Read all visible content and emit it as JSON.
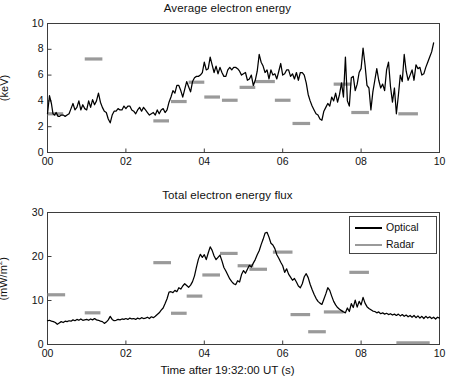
{
  "figure": {
    "background": "#ffffff",
    "optical_color": "#000000",
    "radar_color": "#9a9a9a",
    "axis_color": "#3d3d3d"
  },
  "legend": {
    "position": "top-right-of-bottom-panel",
    "entries": [
      {
        "label": "Optical",
        "color": "#000000"
      },
      {
        "label": "Radar",
        "color": "#9a9a9a"
      }
    ]
  },
  "chart_data": [
    {
      "type": "line",
      "id": "average-electron-energy",
      "title": "Average electron energy",
      "xlabel": "",
      "ylabel": "(keV)",
      "xlim": [
        0,
        10
      ],
      "ylim": [
        0,
        10
      ],
      "xticks": [
        0,
        2,
        4,
        6,
        8,
        10
      ],
      "xticklabels": [
        "00",
        "02",
        "04",
        "06",
        "08",
        "10"
      ],
      "yticks": [
        0,
        2,
        4,
        6,
        8,
        10
      ],
      "yticklabels": [
        "0",
        "2",
        "4",
        "6",
        "8",
        "10"
      ],
      "grid": false,
      "legend": false,
      "series": [
        {
          "name": "Optical",
          "color": "#000000",
          "style": "line",
          "x": [
            0.0,
            0.05,
            0.1,
            0.14,
            0.18,
            0.22,
            0.27,
            0.31,
            0.35,
            0.4,
            0.45,
            0.5,
            0.55,
            0.6,
            0.65,
            0.7,
            0.75,
            0.8,
            0.85,
            0.9,
            0.95,
            1.0,
            1.05,
            1.1,
            1.15,
            1.2,
            1.25,
            1.3,
            1.35,
            1.4,
            1.45,
            1.5,
            1.55,
            1.6,
            1.65,
            1.7,
            1.75,
            1.8,
            1.85,
            1.9,
            1.95,
            2.0,
            2.05,
            2.1,
            2.15,
            2.2,
            2.25,
            2.3,
            2.35,
            2.4,
            2.45,
            2.5,
            2.55,
            2.6,
            2.65,
            2.7,
            2.75,
            2.8,
            2.85,
            2.9,
            2.95,
            3.0,
            3.05,
            3.1,
            3.15,
            3.2,
            3.25,
            3.3,
            3.35,
            3.4,
            3.45,
            3.5,
            3.55,
            3.6,
            3.65,
            3.7,
            3.75,
            3.8,
            3.85,
            3.9,
            3.95,
            4.0,
            4.05,
            4.1,
            4.15,
            4.2,
            4.25,
            4.3,
            4.35,
            4.4,
            4.45,
            4.5,
            4.55,
            4.6,
            4.65,
            4.7,
            4.75,
            4.8,
            4.85,
            4.9,
            4.95,
            5.0,
            5.05,
            5.1,
            5.15,
            5.2,
            5.25,
            5.3,
            5.35,
            5.4,
            5.45,
            5.5,
            5.55,
            5.6,
            5.65,
            5.7,
            5.75,
            5.8,
            5.85,
            5.9,
            5.95,
            6.0,
            6.05,
            6.1,
            6.15,
            6.2,
            6.25,
            6.3,
            6.35,
            6.4,
            6.45,
            6.5,
            6.55,
            6.6,
            6.65,
            6.7,
            6.75,
            6.8,
            6.85,
            6.9,
            6.95,
            7.0,
            7.05,
            7.1,
            7.15,
            7.2,
            7.25,
            7.3,
            7.35,
            7.4,
            7.45,
            7.5,
            7.55,
            7.6,
            7.65,
            7.7,
            7.75,
            7.8,
            7.85,
            7.9,
            7.95,
            8.0,
            8.05,
            8.1,
            8.15,
            8.2,
            8.25,
            8.3,
            8.35,
            8.4,
            8.45,
            8.5,
            8.55,
            8.6,
            8.65,
            8.7,
            8.75,
            8.8,
            8.85,
            8.9,
            8.95,
            9.0,
            9.05,
            9.1,
            9.15,
            9.2,
            9.25,
            9.3,
            9.35,
            9.4,
            9.45,
            9.5,
            9.55,
            9.6,
            9.65,
            9.7,
            9.75,
            9.8,
            9.85,
            9.9,
            9.95,
            10.0
          ],
          "y": [
            3.0,
            4.4,
            3.8,
            3.0,
            2.9,
            3.1,
            2.8,
            2.8,
            2.9,
            2.9,
            2.8,
            2.9,
            3.0,
            3.4,
            3.8,
            3.3,
            3.5,
            4.0,
            3.3,
            3.7,
            3.4,
            3.3,
            4.0,
            3.5,
            4.1,
            3.7,
            4.0,
            4.6,
            3.9,
            3.5,
            3.2,
            3.1,
            2.6,
            2.3,
            2.9,
            3.2,
            3.2,
            3.4,
            3.3,
            3.3,
            3.6,
            3.4,
            3.6,
            3.6,
            3.3,
            3.2,
            3.0,
            3.3,
            3.5,
            3.2,
            3.5,
            3.3,
            3.1,
            2.9,
            3.0,
            3.1,
            2.9,
            3.3,
            3.0,
            3.3,
            3.4,
            3.1,
            3.3,
            3.9,
            4.3,
            4.8,
            4.6,
            5.2,
            5.2,
            4.8,
            4.3,
            4.9,
            5.5,
            5.1,
            4.7,
            5.5,
            5.8,
            5.9,
            5.9,
            6.0,
            6.2,
            7.0,
            6.4,
            6.5,
            7.4,
            6.8,
            6.2,
            6.7,
            6.1,
            6.6,
            6.2,
            5.9,
            5.9,
            6.4,
            6.6,
            6.4,
            6.6,
            6.6,
            6.5,
            6.3,
            6.0,
            6.1,
            6.2,
            5.6,
            5.7,
            6.0,
            5.2,
            5.6,
            6.3,
            7.6,
            7.0,
            6.7,
            6.2,
            6.4,
            5.7,
            6.4,
            6.0,
            6.1,
            5.7,
            6.3,
            6.9,
            6.0,
            6.1,
            6.4,
            6.4,
            5.9,
            6.1,
            5.7,
            6.2,
            5.6,
            6.2,
            6.2,
            6.0,
            5.4,
            4.5,
            4.0,
            3.6,
            3.3,
            3.0,
            2.9,
            2.6,
            2.5,
            3.2,
            3.5,
            3.8,
            3.6,
            4.3,
            4.0,
            4.6,
            3.9,
            4.5,
            5.4,
            4.3,
            7.4,
            4.0,
            3.6,
            5.8,
            5.9,
            4.8,
            5.3,
            6.2,
            6.5,
            8.1,
            6.8,
            5.2,
            5.0,
            3.3,
            4.7,
            5.6,
            6.5,
            5.6,
            5.0,
            5.3,
            4.8,
            6.4,
            7.0,
            5.1,
            3.9,
            5.0,
            3.0,
            4.4,
            6.0,
            5.5,
            7.6,
            6.3,
            5.6,
            6.0,
            6.4,
            5.6,
            6.8,
            6.5,
            6.6,
            6.0,
            6.1,
            6.6,
            7.0,
            7.4,
            7.8,
            8.5
          ]
        },
        {
          "name": "Radar",
          "color": "#9a9a9a",
          "style": "bars",
          "bars": [
            {
              "x0": 0.0,
              "x1": 0.4,
              "y": 3.0
            },
            {
              "x0": 0.95,
              "x1": 1.4,
              "y": 7.25
            },
            {
              "x0": 2.7,
              "x1": 3.1,
              "y": 2.45
            },
            {
              "x0": 3.15,
              "x1": 3.55,
              "y": 3.95
            },
            {
              "x0": 3.6,
              "x1": 4.0,
              "y": 5.45
            },
            {
              "x0": 4.0,
              "x1": 4.4,
              "y": 4.3
            },
            {
              "x0": 4.45,
              "x1": 4.85,
              "y": 4.05
            },
            {
              "x0": 4.9,
              "x1": 5.3,
              "y": 5.05
            },
            {
              "x0": 5.3,
              "x1": 5.8,
              "y": 5.5
            },
            {
              "x0": 5.8,
              "x1": 6.2,
              "y": 4.05
            },
            {
              "x0": 6.25,
              "x1": 6.7,
              "y": 2.25
            },
            {
              "x0": 7.3,
              "x1": 7.75,
              "y": 5.3
            },
            {
              "x0": 7.75,
              "x1": 8.2,
              "y": 3.1
            },
            {
              "x0": 8.95,
              "x1": 9.45,
              "y": 3.0
            }
          ]
        }
      ]
    },
    {
      "type": "line",
      "id": "total-electron-energy-flux",
      "title": "Total electron energy flux",
      "xlabel": "Time after 19:32:00 UT (s)",
      "ylabel": "(mW/m2)",
      "ylabel_display": "(mW/m²)",
      "xlim": [
        0,
        10
      ],
      "ylim": [
        0,
        30
      ],
      "xticks": [
        0,
        2,
        4,
        6,
        8,
        10
      ],
      "xticklabels": [
        "00",
        "02",
        "04",
        "06",
        "08",
        "10"
      ],
      "yticks": [
        0,
        10,
        20,
        30
      ],
      "yticklabels": [
        "0",
        "10",
        "20",
        "30"
      ],
      "grid": false,
      "legend": true,
      "series": [
        {
          "name": "Optical",
          "color": "#000000",
          "style": "line",
          "x": [
            0.0,
            0.05,
            0.1,
            0.15,
            0.2,
            0.25,
            0.3,
            0.35,
            0.4,
            0.45,
            0.5,
            0.55,
            0.6,
            0.65,
            0.7,
            0.75,
            0.8,
            0.85,
            0.9,
            0.95,
            1.0,
            1.05,
            1.1,
            1.15,
            1.2,
            1.25,
            1.3,
            1.35,
            1.4,
            1.45,
            1.5,
            1.55,
            1.6,
            1.65,
            1.7,
            1.75,
            1.8,
            1.85,
            1.9,
            1.95,
            2.0,
            2.05,
            2.1,
            2.15,
            2.2,
            2.25,
            2.3,
            2.35,
            2.4,
            2.45,
            2.5,
            2.55,
            2.6,
            2.65,
            2.7,
            2.75,
            2.8,
            2.85,
            2.9,
            2.95,
            3.0,
            3.05,
            3.1,
            3.15,
            3.2,
            3.25,
            3.3,
            3.35,
            3.4,
            3.45,
            3.5,
            3.55,
            3.6,
            3.65,
            3.7,
            3.75,
            3.8,
            3.85,
            3.9,
            3.95,
            4.0,
            4.05,
            4.1,
            4.15,
            4.2,
            4.25,
            4.3,
            4.35,
            4.4,
            4.45,
            4.5,
            4.55,
            4.6,
            4.65,
            4.7,
            4.75,
            4.8,
            4.85,
            4.9,
            4.95,
            5.0,
            5.05,
            5.1,
            5.15,
            5.2,
            5.25,
            5.3,
            5.35,
            5.4,
            5.45,
            5.5,
            5.55,
            5.6,
            5.65,
            5.7,
            5.75,
            5.8,
            5.85,
            5.9,
            5.95,
            6.0,
            6.05,
            6.1,
            6.15,
            6.2,
            6.25,
            6.3,
            6.35,
            6.4,
            6.45,
            6.5,
            6.55,
            6.6,
            6.65,
            6.7,
            6.75,
            6.8,
            6.85,
            6.9,
            6.95,
            7.0,
            7.05,
            7.1,
            7.15,
            7.2,
            7.25,
            7.3,
            7.35,
            7.4,
            7.45,
            7.5,
            7.55,
            7.6,
            7.65,
            7.7,
            7.75,
            7.8,
            7.85,
            7.9,
            7.95,
            8.0,
            8.05,
            8.1,
            8.15,
            8.2,
            8.25,
            8.3,
            8.35,
            8.4,
            8.45,
            8.5,
            8.55,
            8.6,
            8.65,
            8.7,
            8.75,
            8.8,
            8.85,
            8.9,
            8.95,
            9.0,
            9.05,
            9.1,
            9.15,
            9.2,
            9.25,
            9.3,
            9.35,
            9.4,
            9.45,
            9.5,
            9.55,
            9.6,
            9.65,
            9.7,
            9.75,
            9.8,
            9.85,
            9.9,
            9.95,
            10.0
          ],
          "y": [
            5.4,
            5.5,
            5.3,
            5.2,
            5.0,
            4.6,
            4.9,
            5.2,
            5.0,
            5.3,
            5.2,
            5.4,
            5.3,
            5.6,
            5.4,
            5.7,
            5.5,
            5.8,
            5.5,
            5.6,
            5.7,
            5.5,
            5.8,
            5.6,
            5.9,
            5.6,
            5.5,
            5.3,
            5.2,
            4.8,
            5.1,
            5.6,
            6.4,
            5.7,
            5.4,
            5.5,
            5.7,
            5.6,
            5.8,
            5.7,
            5.9,
            5.7,
            6.0,
            5.8,
            5.9,
            5.7,
            6.0,
            5.8,
            6.1,
            5.9,
            6.0,
            6.2,
            5.9,
            6.3,
            6.1,
            6.4,
            6.8,
            7.2,
            7.8,
            8.3,
            9.3,
            10.4,
            11.9,
            12.0,
            11.8,
            12.3,
            12.0,
            12.9,
            12.6,
            13.3,
            13.8,
            13.4,
            13.0,
            13.5,
            14.3,
            15.6,
            17.6,
            19.4,
            20.5,
            19.8,
            20.4,
            19.3,
            20.8,
            22.2,
            21.4,
            20.1,
            19.3,
            19.8,
            20.3,
            19.0,
            17.5,
            16.7,
            15.8,
            14.9,
            14.3,
            13.8,
            13.6,
            14.5,
            14.2,
            15.9,
            16.8,
            16.2,
            17.1,
            18.0,
            17.6,
            18.5,
            19.3,
            20.4,
            21.3,
            22.7,
            23.9,
            25.3,
            25.5,
            24.4,
            23.0,
            22.6,
            21.8,
            20.4,
            19.6,
            18.7,
            17.9,
            16.4,
            17.2,
            16.0,
            15.3,
            14.6,
            15.0,
            14.2,
            13.3,
            12.9,
            13.8,
            15.4,
            16.1,
            15.2,
            13.7,
            12.5,
            11.4,
            10.5,
            9.8,
            9.4,
            9.1,
            10.3,
            11.5,
            12.9,
            12.3,
            11.0,
            9.8,
            9.0,
            8.4,
            8.0,
            7.7,
            7.4,
            7.2,
            8.3,
            7.5,
            9.3,
            8.4,
            10.1,
            8.5,
            9.8,
            9.0,
            10.7,
            9.4,
            8.6,
            8.2,
            7.9,
            7.6,
            7.5,
            7.2,
            7.4,
            7.0,
            7.2,
            6.9,
            7.1,
            6.8,
            7.0,
            6.7,
            6.9,
            6.6,
            6.9,
            6.5,
            6.8,
            6.4,
            6.7,
            6.3,
            6.6,
            6.2,
            6.6,
            6.1,
            6.5,
            6.0,
            6.4,
            5.9,
            6.4,
            6.0,
            6.3,
            5.9,
            6.2,
            5.8,
            6.2,
            6.0,
            6.4,
            6.1,
            6.5
          ]
        },
        {
          "name": "Radar",
          "color": "#9a9a9a",
          "style": "bars",
          "bars": [
            {
              "x0": 0.0,
              "x1": 0.45,
              "y": 11.3
            },
            {
              "x0": 0.95,
              "x1": 1.35,
              "y": 7.2
            },
            {
              "x0": 2.7,
              "x1": 3.15,
              "y": 18.6
            },
            {
              "x0": 3.15,
              "x1": 3.55,
              "y": 7.1
            },
            {
              "x0": 3.55,
              "x1": 3.95,
              "y": 11.0
            },
            {
              "x0": 3.95,
              "x1": 4.4,
              "y": 15.8
            },
            {
              "x0": 4.4,
              "x1": 4.85,
              "y": 20.7
            },
            {
              "x0": 4.85,
              "x1": 5.25,
              "y": 17.9
            },
            {
              "x0": 5.15,
              "x1": 5.6,
              "y": 17.1
            },
            {
              "x0": 5.75,
              "x1": 6.25,
              "y": 21.0
            },
            {
              "x0": 6.2,
              "x1": 6.7,
              "y": 6.8
            },
            {
              "x0": 6.65,
              "x1": 7.1,
              "y": 2.9
            },
            {
              "x0": 7.05,
              "x1": 7.55,
              "y": 7.4
            },
            {
              "x0": 7.7,
              "x1": 8.2,
              "y": 16.4
            },
            {
              "x0": 8.9,
              "x1": 9.75,
              "y": 0.4
            }
          ]
        }
      ]
    }
  ]
}
